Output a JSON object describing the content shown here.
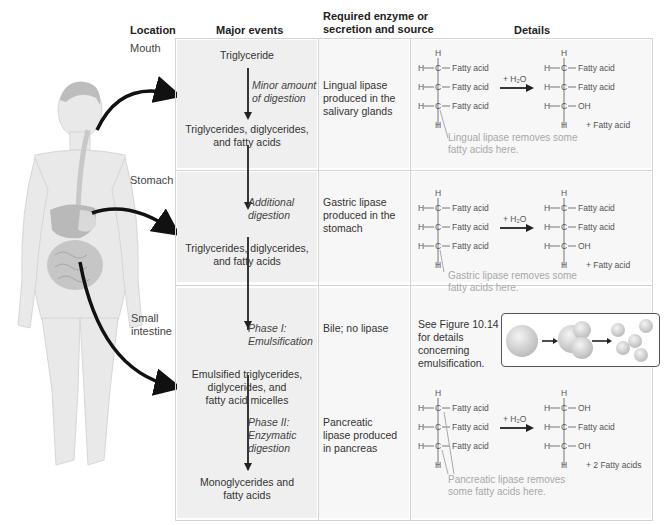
{
  "headers": {
    "location": "Location",
    "major_events": "Major events",
    "enzyme_line1": "Required enzyme or",
    "enzyme_line2": "secretion and source",
    "details": "Details"
  },
  "rows": [
    {
      "location": "Mouth",
      "events": {
        "start": "Triglyceride",
        "step": [
          "Minor amount",
          "of digestion"
        ],
        "result": [
          "Triglycerides, diglycerides,",
          "and fatty acids"
        ]
      },
      "enzyme": [
        "Lingual lipase",
        "produced in the",
        "salivary glands"
      ],
      "details": {
        "reactant": [
          "Fatty acid",
          "Fatty acid",
          "Fatty acid"
        ],
        "reagent": "+ H₂O",
        "product": [
          "Fatty acid",
          "Fatty acid",
          "OH"
        ],
        "byproduct": "+ Fatty acid",
        "note": [
          "Lingual lipase removes some",
          "fatty acids here."
        ]
      }
    },
    {
      "location": "Stomach",
      "events": {
        "step": [
          "Additional",
          "digestion"
        ],
        "result": [
          "Triglycerides, diglycerides,",
          "and fatty acids"
        ]
      },
      "enzyme": [
        "Gastric lipase",
        "produced in the",
        "stomach"
      ],
      "details": {
        "reactant": [
          "Fatty acid",
          "Fatty acid",
          "Fatty acid"
        ],
        "reagent": "+ H₂O",
        "product": [
          "Fatty acid",
          "Fatty acid",
          "OH"
        ],
        "byproduct": "+ Fatty acid",
        "note": [
          "Gastric lipase removes some",
          "fatty acids here."
        ]
      }
    },
    {
      "location": [
        "Small",
        "intestine"
      ],
      "events": {
        "phase1": [
          "Phase I:",
          "Emulsification"
        ],
        "mid_result": [
          "Emulsified triglycerides,",
          "diglycerides, and",
          "fatty acid micelles"
        ],
        "phase2": [
          "Phase II:",
          "Enzymatic",
          "digestion"
        ],
        "result": [
          "Monoglycerides and",
          "fatty acids"
        ]
      },
      "enzyme_phase1": "Bile; no lipase",
      "enzyme_phase2": [
        "Pancreatic",
        "lipase produced",
        "in pancreas"
      ],
      "details": {
        "figure_ref": [
          "See Figure 10.14",
          "for details",
          "concerning",
          "emulsification."
        ],
        "reactant": [
          "Fatty acid",
          "Fatty acid",
          "Fatty acid"
        ],
        "reagent": "+ H₂O",
        "product": [
          "OH",
          "Fatty acid",
          "OH"
        ],
        "byproduct": "+ 2 Fatty acids",
        "note": [
          "Pancreatic lipase removes",
          "some fatty acids here."
        ]
      }
    }
  ],
  "chem": {
    "H": "H",
    "C": "C"
  },
  "colors": {
    "shade": "#efefef",
    "grid": "#d4d4d4",
    "note": "#a8a8a8",
    "arrow": "#111111"
  }
}
